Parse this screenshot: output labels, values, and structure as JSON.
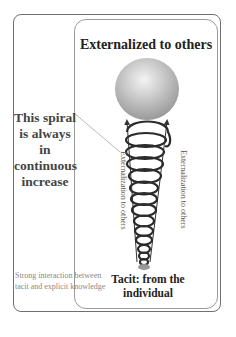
{
  "diagram": {
    "top_label": "Externalized to others",
    "bottom_label": "Tacit: from the individual",
    "spiral_note": "This spiral is always in continuous increase",
    "interaction_note": "Strong interaction between tacit and explicit knowledge",
    "left_arrow_label": "Externalization to others",
    "right_arrow_label": "Externalization to others"
  },
  "colors": {
    "frame": "#707070",
    "spiral": "#2b2b2b",
    "ball_light": "#eeeeee",
    "ball_dark": "#9a9a9a",
    "note_text": "#444444",
    "interaction_text": "#888888"
  }
}
